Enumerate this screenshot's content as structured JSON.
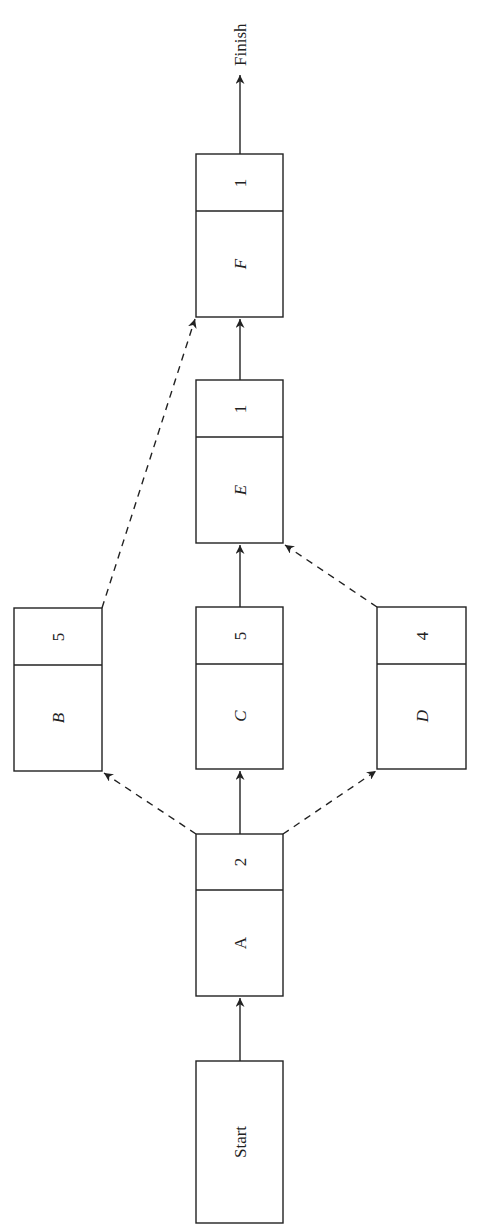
{
  "diagram": {
    "type": "activity-on-node network",
    "orientation": "rotated 90deg counter-clockwise (flow bottom to top)",
    "start_label": "Start",
    "finish_label": "Finish",
    "nodes": [
      {
        "id": "A",
        "label": "A",
        "duration": "2",
        "italic": false
      },
      {
        "id": "B",
        "label": "B",
        "duration": "5",
        "italic": true
      },
      {
        "id": "C",
        "label": "C",
        "duration": "5",
        "italic": true
      },
      {
        "id": "D",
        "label": "D",
        "duration": "4",
        "italic": true
      },
      {
        "id": "E",
        "label": "E",
        "duration": "1",
        "italic": true
      },
      {
        "id": "F",
        "label": "F",
        "duration": "1",
        "italic": true
      }
    ],
    "edges": [
      {
        "from": "Start",
        "to": "A",
        "style": "solid"
      },
      {
        "from": "A",
        "to": "B",
        "style": "dashed"
      },
      {
        "from": "A",
        "to": "C",
        "style": "solid"
      },
      {
        "from": "A",
        "to": "D",
        "style": "dashed"
      },
      {
        "from": "C",
        "to": "E",
        "style": "solid"
      },
      {
        "from": "D",
        "to": "E",
        "style": "dashed"
      },
      {
        "from": "E",
        "to": "F",
        "style": "solid"
      },
      {
        "from": "B",
        "to": "F",
        "style": "dashed"
      },
      {
        "from": "F",
        "to": "Finish",
        "style": "solid"
      }
    ]
  }
}
